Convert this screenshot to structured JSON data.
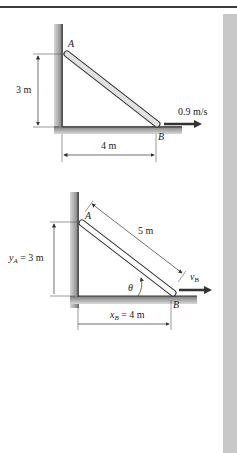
{
  "figure1": {
    "point_a_label": "A",
    "point_b_label": "B",
    "height_label": "3 m",
    "base_label": "4 m",
    "velocity_label": "0.9 m/s"
  },
  "figure2": {
    "point_a_label": "A",
    "point_b_label": "B",
    "length_label": "5 m",
    "ya_symbol": "y",
    "ya_subscript": "A",
    "ya_value": " = 3 m",
    "xb_symbol": "x",
    "xb_subscript": "B",
    "xb_value": " = 4 m",
    "angle_label": "θ",
    "velocity_symbol": "v",
    "velocity_subscript": "B"
  },
  "colors": {
    "wall": "#8a8a8a",
    "rod_fill": "#e2e2e2",
    "rod_stroke": "#333333",
    "arrow": "#333333",
    "strip": "#c8c8c8"
  }
}
